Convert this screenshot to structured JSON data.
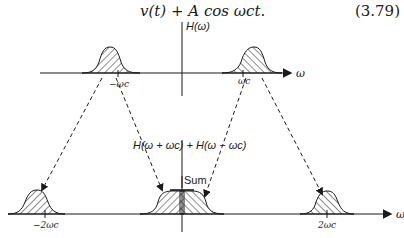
{
  "equation": {
    "text": "v(t) + A cos ωₑt.",
    "display": "v(t) + A cos ωct.",
    "number": "(3.79)"
  },
  "top_plot": {
    "y_axis_label": "H(ω)",
    "x_axis_label": "ω",
    "left_tick": "−ωc",
    "right_tick": "ωc"
  },
  "bottom_plot": {
    "sum_label": "H(ω + ωc) + H(ω − ωc)",
    "sum_annotation": "Sum",
    "left_tick": "−2ωc",
    "right_tick": "2ωc",
    "x_axis_label": "ω"
  },
  "colors": {
    "ink": "#1a1a1a",
    "background": "#ffffff"
  }
}
